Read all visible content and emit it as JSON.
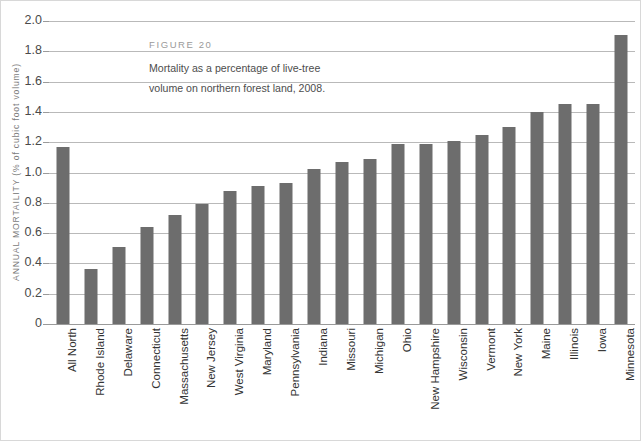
{
  "chart_data": {
    "type": "bar",
    "title": "",
    "xlabel": "",
    "ylabel": "ANNUAL MORTAILITY (% of cubic foot volume)",
    "ylim": [
      0,
      2.0
    ],
    "grid": true,
    "legend": "none",
    "bar_color": "#6d6d6d",
    "y_ticks": [
      "2.0",
      "1.8",
      "1.6",
      "1.4",
      "1.2",
      "1.0",
      "0.8",
      "0.6",
      "0.4",
      "0.2",
      "0"
    ],
    "y_tick_values": [
      2.0,
      1.8,
      1.6,
      1.4,
      1.2,
      1.0,
      0.8,
      0.6,
      0.4,
      0.2,
      0
    ],
    "categories": [
      "All North",
      "Rhode Island",
      "Delaware",
      "Connecticut",
      "Massachusetts",
      "New Jersey",
      "West Virginia",
      "Maryland",
      "Pennsylvania",
      "Indiana",
      "Missouri",
      "Michigan",
      "Ohio",
      "New Hampshire",
      "Wisconsin",
      "Vermont",
      "New York",
      "Maine",
      "Illinois",
      "Iowa",
      "Minnesota"
    ],
    "values": [
      1.17,
      0.36,
      0.51,
      0.64,
      0.72,
      0.79,
      0.88,
      0.91,
      0.93,
      1.02,
      1.07,
      1.09,
      1.19,
      1.19,
      1.21,
      1.25,
      1.3,
      1.4,
      1.45,
      1.45,
      1.91
    ]
  },
  "caption": {
    "figure_label": "FIGURE 20",
    "line1": "Mortality as a percentage of live-tree",
    "line2": "volume on northern forest land, 2008."
  }
}
